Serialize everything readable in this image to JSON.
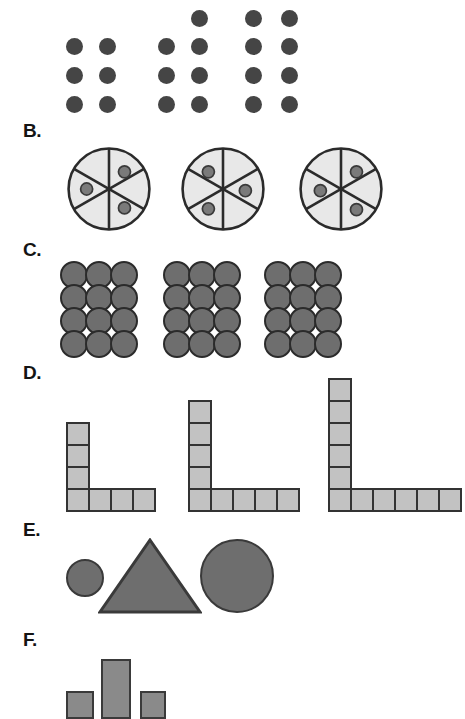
{
  "figure": {
    "background_color": "#ffffff",
    "width": 465,
    "height": 719
  },
  "colors": {
    "dot_dark": "#454545",
    "circle_fill_gray": "#6e6e6e",
    "outline_dark": "#2b2b2b",
    "pie_fill_light": "#e8e8e8",
    "pie_line": "#2b2b2b",
    "pie_dot": "#7a7a7a",
    "square_fill": "#c2c2c2",
    "square_outline": "#333333",
    "bar_fill": "#8a8a8a",
    "label_color": "#141414"
  },
  "panels": [
    {
      "id": "A",
      "label": "",
      "label_visible": false,
      "type": "dot-array",
      "description": "Three groups of dark dots arranged in columns of two",
      "groups": [
        {
          "name": "group-1",
          "count": 6,
          "rows": 3,
          "cols": 2,
          "extra_top_dot": false
        },
        {
          "name": "group-2",
          "count": 7,
          "rows": 3,
          "cols": 2,
          "extra_top_dot": true
        },
        {
          "name": "group-3",
          "count": 8,
          "rows": 4,
          "cols": 2,
          "extra_top_dot": false
        }
      ]
    },
    {
      "id": "B",
      "label": "B.",
      "label_visible": true,
      "type": "sectored-circle",
      "description": "Three circles each divided into six equal sectors with three small dots in alternating sectors",
      "groups": [
        {
          "name": "pie-1",
          "sectors": 6,
          "dots": 3,
          "dot_sectors": [
            "upper-right",
            "left",
            "lower-right"
          ]
        },
        {
          "name": "pie-2",
          "sectors": 6,
          "dots": 3,
          "dot_sectors": [
            "upper-left",
            "right",
            "lower-left"
          ]
        },
        {
          "name": "pie-3",
          "sectors": 6,
          "dots": 3,
          "dot_sectors": [
            "upper-right",
            "left",
            "lower-right"
          ]
        }
      ]
    },
    {
      "id": "C",
      "label": "C.",
      "label_visible": true,
      "type": "packed-circles",
      "description": "Three blocks of tightly packed gray circles, four rows by three columns",
      "groups": [
        {
          "name": "block-1",
          "count": 12,
          "rows": 4,
          "cols": 3
        },
        {
          "name": "block-2",
          "count": 12,
          "rows": 4,
          "cols": 3
        },
        {
          "name": "block-3",
          "count": 12,
          "rows": 4,
          "cols": 3
        }
      ]
    },
    {
      "id": "D",
      "label": "D.",
      "label_visible": true,
      "type": "l-shape-squares",
      "description": "Three L-shaped chains of squares of increasing length",
      "groups": [
        {
          "name": "l-shape-1",
          "count": 7,
          "vertical_above_corner": 3,
          "horizontal_right_of_corner": 3
        },
        {
          "name": "l-shape-2",
          "count": 9,
          "vertical_above_corner": 4,
          "horizontal_right_of_corner": 4
        },
        {
          "name": "l-shape-3",
          "count": 11,
          "vertical_above_corner": 5,
          "horizontal_right_of_corner": 5
        }
      ]
    },
    {
      "id": "E",
      "label": "E.",
      "label_visible": true,
      "type": "solid-shapes",
      "description": "A small circle, a triangle, and a large circle, all solid gray",
      "groups": [
        {
          "name": "small-circle",
          "shape": "circle",
          "size": 40
        },
        {
          "name": "triangle",
          "shape": "triangle",
          "size": 100
        },
        {
          "name": "large-circle",
          "shape": "circle",
          "size": 90
        }
      ]
    },
    {
      "id": "F",
      "label": "F.",
      "label_visible": true,
      "type": "bars",
      "description": "A small square, a tall rectangle, and a small square",
      "groups": [
        {
          "name": "bar-left",
          "shape": "square",
          "width": 32,
          "height": 34
        },
        {
          "name": "bar-center",
          "shape": "rectangle",
          "width": 40,
          "height": 80
        },
        {
          "name": "bar-right",
          "shape": "square",
          "width": 30,
          "height": 32
        }
      ]
    }
  ]
}
